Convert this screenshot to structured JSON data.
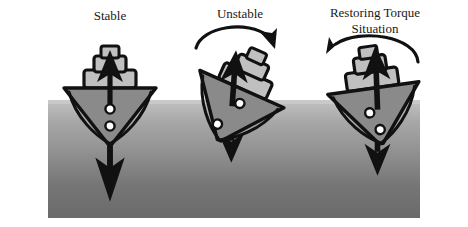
{
  "diagram": {
    "title_semantic": "ship-stability-diagram",
    "background_color": "#ffffff",
    "water": {
      "name": "water-region",
      "top_color": "#b9b9b9",
      "mid_color": "#8d8d8d",
      "bottom_color": "#6d6d6d",
      "surface_color": "#c9c9c9",
      "x": 48,
      "y": 100,
      "width": 372,
      "height": 118
    },
    "ink_color": "#111111",
    "hull_fill": "#8a8a8a",
    "cabin_fill": "#c0c0c0",
    "marker_fill": "#ffffff"
  },
  "labels": [
    {
      "id": "stable",
      "text": "Stable",
      "x": 110,
      "y": 20,
      "font_size": 13
    },
    {
      "id": "unstable",
      "text": "Unstable",
      "x": 240,
      "y": 18,
      "font_size": 13
    },
    {
      "id": "restoring-line1",
      "text": "Restoring Torque",
      "x": 375,
      "y": 17,
      "font_size": 13
    },
    {
      "id": "restoring-line2",
      "text": "Situation",
      "x": 375,
      "y": 33,
      "font_size": 13
    }
  ],
  "scenarios": [
    {
      "id": "stable",
      "label": "Stable",
      "tilt_degrees": 0,
      "center_x": 110,
      "has_rotation_arrow": false,
      "rotation_direction": "none",
      "buoyancy_arrow": {
        "name": "buoyancy-force-arrow",
        "direction": "up",
        "length": 52
      },
      "weight_arrow": {
        "name": "weight-force-arrow",
        "direction": "down",
        "length": 86
      },
      "markers": [
        {
          "name": "center-of-buoyancy-marker",
          "offset": 0,
          "depth": 7
        },
        {
          "name": "center-of-gravity-marker",
          "offset": 0,
          "depth": 26
        }
      ]
    },
    {
      "id": "unstable",
      "label": "Unstable",
      "tilt_degrees": 24,
      "center_x": 237,
      "has_rotation_arrow": true,
      "rotation_direction": "clockwise",
      "buoyancy_arrow": {
        "name": "buoyancy-force-arrow",
        "direction": "up",
        "length": 46
      },
      "weight_arrow": {
        "name": "weight-force-arrow",
        "direction": "down",
        "length": 50
      },
      "markers": [
        {
          "name": "center-of-buoyancy-marker",
          "offset": 0,
          "depth": 6
        },
        {
          "name": "center-of-gravity-marker",
          "offset": 0,
          "depth": 30
        }
      ]
    },
    {
      "id": "restoring-torque",
      "label": "Restoring Torque Situation",
      "tilt_degrees": -8,
      "center_x": 375,
      "has_rotation_arrow": true,
      "rotation_direction": "counterclockwise",
      "buoyancy_arrow": {
        "name": "buoyancy-force-arrow",
        "direction": "up",
        "length": 54
      },
      "weight_arrow": {
        "name": "weight-force-arrow",
        "direction": "down",
        "length": 62
      },
      "markers": [
        {
          "name": "center-of-buoyancy-marker",
          "offset": 0,
          "depth": 8
        },
        {
          "name": "center-of-gravity-marker",
          "offset": 0,
          "depth": 26
        }
      ]
    }
  ]
}
